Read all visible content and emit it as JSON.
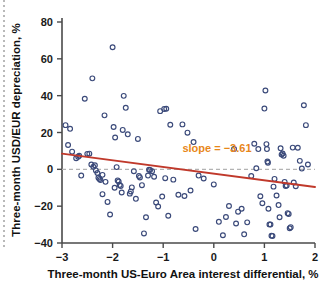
{
  "figure": {
    "background_color": "#ffffff",
    "left_margin_rule": "dotted-vertical-rule"
  },
  "chart_data": {
    "type": "scatter",
    "title": "",
    "subtitle": "",
    "xlabel": "Three-month US-Euro Area interest differential, %",
    "ylabel": "Three-month USD/EUR depreciation, %",
    "xlim": [
      -3,
      2
    ],
    "ylim": [
      -40,
      80
    ],
    "xticks": [
      -3,
      -2,
      -1,
      0,
      1,
      2
    ],
    "xtick_labels": [
      "−3",
      "−2",
      "−1",
      "0",
      "1",
      "2"
    ],
    "yticks": [
      -40,
      -20,
      0,
      20,
      40,
      60,
      80
    ],
    "ytick_labels": [
      "−40",
      "−20",
      "0",
      "20",
      "40",
      "60",
      "80"
    ],
    "grid": false,
    "legend": null,
    "marker": {
      "shape": "circle-open",
      "edge_color": "#3b4a7a",
      "face_color": "none",
      "size_px": 3.0
    },
    "annotations": [
      {
        "name": "slope-annotation",
        "text": "slope = −3.61",
        "color": "#e8871a",
        "x": -0.62,
        "y": 9.5
      }
    ],
    "reference_lines": [
      {
        "name": "zero-line",
        "orientation": "horizontal",
        "y": 0,
        "color": "#b3b3b3",
        "style": "dashed"
      }
    ],
    "fit_line": {
      "name": "regression-line",
      "slope": -3.61,
      "color": "#c0392b",
      "x_start": -3,
      "y_start": 8.5,
      "x_end": 2,
      "y_end": -9.6
    },
    "points": [
      [
        -2.93,
        24.0
      ],
      [
        -2.88,
        13.2
      ],
      [
        -2.84,
        22.0
      ],
      [
        -2.8,
        9.6
      ],
      [
        -2.72,
        6.0
      ],
      [
        -2.68,
        6.8
      ],
      [
        -2.66,
        7.4
      ],
      [
        -2.62,
        -3.4
      ],
      [
        -2.55,
        38.3
      ],
      [
        -2.5,
        8.4
      ],
      [
        -2.46,
        8.5
      ],
      [
        -2.42,
        2.6
      ],
      [
        -2.4,
        49.4
      ],
      [
        -2.38,
        1.4
      ],
      [
        -2.35,
        2.2
      ],
      [
        -2.33,
        -0.6
      ],
      [
        -2.3,
        -2.0
      ],
      [
        -2.28,
        -4.6
      ],
      [
        -2.26,
        -5.2
      ],
      [
        -2.24,
        -5.8
      ],
      [
        -2.2,
        -13.5
      ],
      [
        -2.16,
        29.3
      ],
      [
        -2.1,
        -17.7
      ],
      [
        -2.05,
        -24.5
      ],
      [
        -2.0,
        66.3
      ],
      [
        -1.98,
        23.0
      ],
      [
        -1.95,
        17.3
      ],
      [
        -1.92,
        1.2
      ],
      [
        -1.9,
        -6.0
      ],
      [
        -1.88,
        -6.6
      ],
      [
        -1.86,
        -8.5
      ],
      [
        -1.84,
        -9.0
      ],
      [
        -1.82,
        -12.6
      ],
      [
        -1.8,
        21.4
      ],
      [
        -1.78,
        39.9
      ],
      [
        -1.74,
        33.4
      ],
      [
        -1.7,
        19.0
      ],
      [
        -1.66,
        -13.2
      ],
      [
        -1.62,
        -9.8
      ],
      [
        -1.58,
        -1.0
      ],
      [
        -1.54,
        -16.0
      ],
      [
        -1.5,
        16.5
      ],
      [
        -1.48,
        -3.6
      ],
      [
        -1.46,
        -4.4
      ],
      [
        -1.42,
        -8.6
      ],
      [
        -1.38,
        -34.8
      ],
      [
        -1.34,
        -26.0
      ],
      [
        -1.3,
        -3.4
      ],
      [
        -1.26,
        -0.4
      ],
      [
        -1.22,
        -1.0
      ],
      [
        -1.18,
        -4.0
      ],
      [
        -1.14,
        -18.0
      ],
      [
        -1.1,
        -20.2
      ],
      [
        -1.06,
        31.6
      ],
      [
        -1.02,
        -14.8
      ],
      [
        -0.98,
        32.8
      ],
      [
        -0.94,
        32.9
      ],
      [
        -0.9,
        -25.2
      ],
      [
        -0.86,
        24.2
      ],
      [
        -0.8,
        -5.6
      ],
      [
        -0.7,
        -13.8
      ],
      [
        -0.62,
        24.4
      ],
      [
        -0.58,
        -14.5
      ],
      [
        -0.52,
        19.9
      ],
      [
        -0.46,
        -11.5
      ],
      [
        -0.4,
        14.8
      ],
      [
        -0.36,
        -32.4
      ],
      [
        -0.3,
        -3.4
      ],
      [
        -0.2,
        -5.0
      ],
      [
        0.0,
        -8.2
      ],
      [
        0.1,
        -28.5
      ],
      [
        0.18,
        -35.8
      ],
      [
        0.24,
        -25.9
      ],
      [
        0.3,
        -19.9
      ],
      [
        0.4,
        11.0
      ],
      [
        0.48,
        -23.0
      ],
      [
        0.55,
        -21.4
      ],
      [
        0.6,
        -35.3
      ],
      [
        0.66,
        -28.8
      ],
      [
        0.74,
        -3.6
      ],
      [
        0.8,
        13.9
      ],
      [
        0.84,
        0.6
      ],
      [
        0.88,
        11.0
      ],
      [
        0.92,
        -14.6
      ],
      [
        0.96,
        -18.4
      ],
      [
        1.0,
        33.0
      ],
      [
        1.02,
        42.8
      ],
      [
        1.04,
        13.7
      ],
      [
        1.05,
        11.0
      ],
      [
        1.06,
        4.2
      ],
      [
        1.07,
        3.6
      ],
      [
        1.08,
        -21.4
      ],
      [
        1.1,
        -29.9
      ],
      [
        1.12,
        -30.0
      ],
      [
        1.14,
        -36.0
      ],
      [
        1.16,
        -36.2
      ],
      [
        1.2,
        -5.2
      ],
      [
        1.24,
        -14.2
      ],
      [
        1.28,
        -19.4
      ],
      [
        1.3,
        -26.0
      ],
      [
        1.32,
        11.4
      ],
      [
        1.34,
        8.0
      ],
      [
        1.36,
        8.6
      ],
      [
        1.38,
        7.4
      ],
      [
        1.4,
        -6.8
      ],
      [
        1.42,
        -9.0
      ],
      [
        1.44,
        -8.8
      ],
      [
        1.46,
        -23.8
      ],
      [
        1.48,
        -24.2
      ],
      [
        1.5,
        -32.0
      ],
      [
        1.52,
        -31.4
      ],
      [
        1.56,
        11.8
      ],
      [
        1.58,
        -7.2
      ],
      [
        1.62,
        -9.2
      ],
      [
        1.66,
        11.7
      ],
      [
        1.7,
        4.6
      ],
      [
        1.74,
        0.4
      ],
      [
        1.78,
        34.8
      ],
      [
        1.82,
        24.0
      ],
      [
        1.86,
        2.6
      ],
      [
        -2.2,
        -3.0
      ],
      [
        -2.14,
        -6.8
      ],
      [
        -1.96,
        -10.0
      ],
      [
        -1.64,
        -12.0
      ],
      [
        -1.28,
        -0.2
      ],
      [
        -0.96,
        -4.8
      ],
      [
        0.44,
        -29.4
      ],
      [
        1.18,
        -9.4
      ]
    ]
  }
}
